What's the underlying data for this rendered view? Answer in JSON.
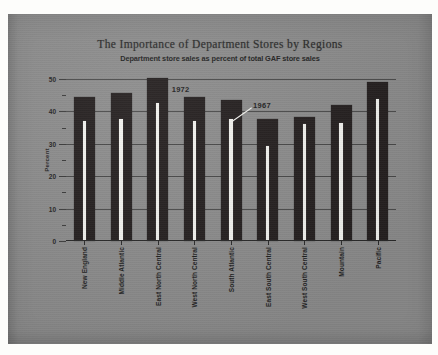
{
  "chart_data": {
    "type": "bar",
    "title": "The Importance of Department Stores by Regions",
    "subtitle": "Department store sales as percent of total GAF store sales",
    "xlabel": "",
    "ylabel": "Percent",
    "ylim": [
      0,
      50
    ],
    "yticks": [
      0,
      10,
      20,
      30,
      40,
      50
    ],
    "ytick_labels": [
      "0",
      "10",
      "20",
      "30",
      "40",
      "50"
    ],
    "yticks_minor": [
      5,
      15,
      25,
      35,
      45
    ],
    "grid": true,
    "legend_position": "annotations",
    "categories": [
      "New England",
      "Middle Atlantic",
      "East North Central",
      "West North Central",
      "South Atlantic",
      "East South Central",
      "West South Central",
      "Mountain",
      "Pacific"
    ],
    "series": [
      {
        "name": "1972",
        "color": "#241f1f",
        "values": [
          44.4,
          45.6,
          50.2,
          44.6,
          43.4,
          37.8,
          38.3,
          42.0,
          49.0
        ]
      },
      {
        "name": "1967",
        "color": "#f2f2ee",
        "values": [
          37.0,
          37.8,
          42.6,
          36.9,
          37.7,
          29.4,
          36.2,
          36.3,
          43.8
        ]
      }
    ],
    "annotations": [
      {
        "text": "1972",
        "series": "1972"
      },
      {
        "text": "1967",
        "series": "1967"
      }
    ]
  }
}
